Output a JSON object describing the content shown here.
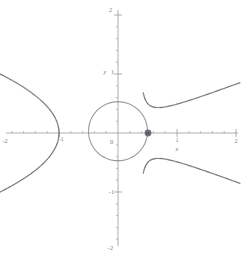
{
  "figure": {
    "width": 243,
    "height": 255,
    "background": "#ffffff",
    "style": "point-sampled cas plot"
  },
  "axes": {
    "x_label": "x",
    "y_label": "y",
    "axis_color": "#9a9a9a",
    "tick_color": "#9a9a9a",
    "label_color": "#7a7a7a",
    "x_tick_labels": [
      "-2",
      "-1",
      "1",
      "2"
    ],
    "y_tick_labels": [
      "2",
      "1",
      "-1",
      "-2"
    ],
    "origin_label": "0",
    "xlim": [
      -2,
      2
    ],
    "ylim": [
      -2,
      2
    ],
    "major_ticks": [
      -2,
      -1,
      1,
      2
    ],
    "minor_ticks_per_major": 5,
    "grid": false
  },
  "marker": {
    "name": "focus-point",
    "x": 0.5,
    "y": 0,
    "color": "#6e6e78",
    "radius_px": 3.4
  },
  "chart_data": {
    "type": "scatter",
    "title": "",
    "xlabel": "x",
    "ylabel": "y",
    "xlim": [
      -2,
      2
    ],
    "ylim": [
      -2,
      2
    ],
    "grid": false,
    "legend": "none",
    "series": [
      {
        "name": "circle",
        "kind": "closed-curve",
        "color": "#8d8d96",
        "style": "dotted",
        "center": [
          0.0,
          0.03
        ],
        "radius": 0.5,
        "note": "dotted circle through marked point near (0.5, 0)"
      },
      {
        "name": "left-branch",
        "kind": "open-curve",
        "color": "#6e6e78",
        "style": "dotted-dense-near-vertex",
        "vertex": [
          -1.0,
          0.0
        ],
        "opens": "left",
        "points": [
          [
            -1.0,
            0.0
          ],
          [
            -1.02,
            0.14
          ],
          [
            -1.06,
            0.26
          ],
          [
            -1.13,
            0.38
          ],
          [
            -1.22,
            0.49
          ],
          [
            -1.33,
            0.59
          ],
          [
            -1.46,
            0.69
          ],
          [
            -1.6,
            0.78
          ],
          [
            -1.76,
            0.87
          ],
          [
            -1.93,
            0.96
          ],
          [
            -2.0,
            1.0
          ],
          [
            -1.02,
            -0.14
          ],
          [
            -1.06,
            -0.26
          ],
          [
            -1.13,
            -0.38
          ],
          [
            -1.22,
            -0.49
          ],
          [
            -1.33,
            -0.59
          ],
          [
            -1.46,
            -0.69
          ],
          [
            -1.6,
            -0.78
          ],
          [
            -1.76,
            -0.87
          ],
          [
            -1.93,
            -0.96
          ],
          [
            -2.0,
            -1.0
          ]
        ]
      },
      {
        "name": "upper-right-branch",
        "kind": "open-curve",
        "color": "#6e6e78",
        "style": "dotted-dense-near-minimum",
        "minimum": [
          0.95,
          0.41
        ],
        "asymptote_x": 0.33,
        "points": [
          [
            0.34,
            2.0
          ],
          [
            0.35,
            1.7
          ],
          [
            0.37,
            1.45
          ],
          [
            0.4,
            1.22
          ],
          [
            0.45,
            1.02
          ],
          [
            0.52,
            0.85
          ],
          [
            0.6,
            0.7
          ],
          [
            0.7,
            0.58
          ],
          [
            0.82,
            0.48
          ],
          [
            0.95,
            0.42
          ],
          [
            1.1,
            0.4
          ],
          [
            1.25,
            0.42
          ],
          [
            1.4,
            0.47
          ],
          [
            1.55,
            0.55
          ],
          [
            1.7,
            0.66
          ],
          [
            1.85,
            0.8
          ],
          [
            2.0,
            0.97
          ]
        ]
      },
      {
        "name": "lower-right-branch",
        "kind": "open-curve",
        "color": "#6e6e78",
        "style": "dotted-dense-near-maximum",
        "maximum": [
          0.95,
          -0.41
        ],
        "asymptote_x": 0.33,
        "points": [
          [
            0.34,
            -2.0
          ],
          [
            0.35,
            -1.7
          ],
          [
            0.37,
            -1.45
          ],
          [
            0.4,
            -1.22
          ],
          [
            0.45,
            -1.02
          ],
          [
            0.52,
            -0.85
          ],
          [
            0.6,
            -0.7
          ],
          [
            0.7,
            -0.58
          ],
          [
            0.82,
            -0.48
          ],
          [
            0.95,
            -0.42
          ],
          [
            1.1,
            -0.4
          ],
          [
            1.25,
            -0.42
          ],
          [
            1.4,
            -0.47
          ],
          [
            1.55,
            -0.55
          ],
          [
            1.7,
            -0.66
          ],
          [
            1.85,
            -0.8
          ],
          [
            2.0,
            -0.97
          ]
        ]
      }
    ]
  }
}
